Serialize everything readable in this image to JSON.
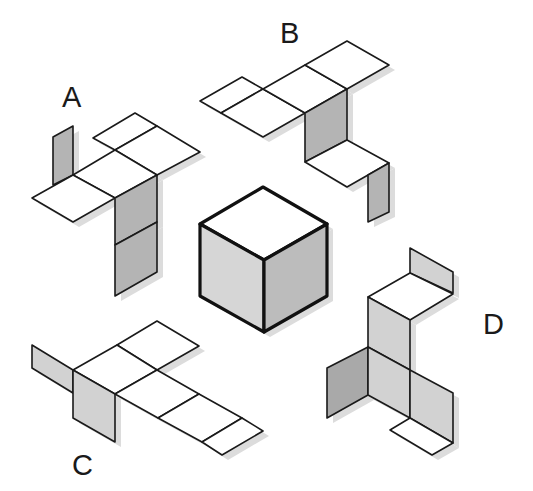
{
  "colors": {
    "white_face": "#ffffff",
    "gray_face": "#b4b4b4",
    "dark_gray_face": "#a9a9a9",
    "light_gray_face": "#d2d2d2",
    "cube_left": "#d6d6d6",
    "cube_right": "#bcbcbc",
    "outline": "#1a1a1a",
    "shadow": "#dcdcdc"
  },
  "labels": {
    "A": "A",
    "B": "B",
    "C": "C",
    "D": "D"
  },
  "cube": {
    "faces": [
      {
        "name": "top",
        "fill": "#ffffff",
        "points": "263,187 327,224 264,260 200,224"
      },
      {
        "name": "left",
        "fill": "#d6d6d6",
        "points": "200,224 264,260 264,332 200,296"
      },
      {
        "name": "right",
        "fill": "#bcbcbc",
        "points": "264,260 327,224 327,296 264,332"
      }
    ]
  },
  "nets": {
    "A": {
      "faces": [
        {
          "fill": "#b4b4b4",
          "points": "53,137 73,126 73,175 53,185"
        },
        {
          "fill": "#ffffff",
          "points": "93,138 135,113 157,126 115,150"
        },
        {
          "fill": "#ffffff",
          "points": "115,150 157,126 200,152 157,175"
        },
        {
          "fill": "#ffffff",
          "points": "73,175 115,150 157,175 115,198"
        },
        {
          "fill": "#ffffff",
          "points": "32,198 73,175 115,198 73,222"
        },
        {
          "fill": "#b4b4b4",
          "points": "115,198 157,175 157,222 115,245"
        },
        {
          "fill": "#b4b4b4",
          "points": "115,245 157,222 157,272 115,296"
        }
      ]
    },
    "B": {
      "faces": [
        {
          "fill": "#ffffff",
          "points": "200,101 242,77 263,89 221,113"
        },
        {
          "fill": "#ffffff",
          "points": "221,113 263,89 305,113 263,137"
        },
        {
          "fill": "#ffffff",
          "points": "263,89 305,65 347,89 305,113"
        },
        {
          "fill": "#ffffff",
          "points": "305,65 347,41 389,65 347,89"
        },
        {
          "fill": "#b4b4b4",
          "points": "305,113 347,89 347,140 305,162"
        },
        {
          "fill": "#ffffff",
          "points": "305,162 347,140 389,163 347,187"
        },
        {
          "fill": "#b4b4b4",
          "points": "368,175 389,163 389,212 368,222"
        }
      ]
    },
    "C": {
      "faces": [
        {
          "fill": "#ffffff",
          "points": "117,345 157,321 199,346 157,370"
        },
        {
          "fill": "#ffffff",
          "points": "73,370 117,345 157,370 115,394"
        },
        {
          "fill": "#d2d2d2",
          "points": "32,345 73,370 73,393 32,368"
        },
        {
          "fill": "#d2d2d2",
          "points": "73,370 115,394 115,442 73,418"
        },
        {
          "fill": "#ffffff",
          "points": "115,394 157,370 199,394 158,418"
        },
        {
          "fill": "#ffffff",
          "points": "158,418 199,394 242,418 202,442"
        },
        {
          "fill": "#ffffff",
          "points": "202,442 242,418 263,431 222,455"
        }
      ]
    },
    "D": {
      "faces": [
        {
          "fill": "#d2d2d2",
          "points": "410,248 453,272 453,293 410,273"
        },
        {
          "fill": "#ffffff",
          "points": "368,297 410,273 453,294 410,320"
        },
        {
          "fill": "#d2d2d2",
          "points": "368,297 410,320 410,370 368,347"
        },
        {
          "fill": "#a9a9a9",
          "points": "327,368 368,347 368,395 327,418"
        },
        {
          "fill": "#d2d2d2",
          "points": "368,347 410,370 410,418 368,395"
        },
        {
          "fill": "#d2d2d2",
          "points": "410,370 453,393 453,443 410,418"
        },
        {
          "fill": "#ffffff",
          "points": "390,430 410,418 453,443 432,455"
        }
      ]
    }
  }
}
